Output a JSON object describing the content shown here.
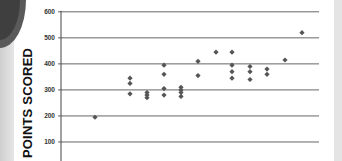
{
  "chart_data": {
    "type": "scatter",
    "title": "",
    "xlabel": "",
    "ylabel": "POINTS SCORED",
    "ylim": [
      0,
      600
    ],
    "yticks": [
      100,
      200,
      300,
      400,
      500,
      600
    ],
    "grid": true,
    "legend": null,
    "marker": "diamond",
    "marker_color": "#555555",
    "points": [
      {
        "col": 0,
        "y": 195
      },
      {
        "col": 1,
        "y": 345
      },
      {
        "col": 1,
        "y": 325
      },
      {
        "col": 1,
        "y": 285
      },
      {
        "col": 2,
        "y": 290
      },
      {
        "col": 2,
        "y": 280
      },
      {
        "col": 2,
        "y": 270
      },
      {
        "col": 3,
        "y": 395
      },
      {
        "col": 3,
        "y": 360
      },
      {
        "col": 3,
        "y": 305
      },
      {
        "col": 3,
        "y": 280
      },
      {
        "col": 4,
        "y": 310
      },
      {
        "col": 4,
        "y": 300
      },
      {
        "col": 4,
        "y": 290
      },
      {
        "col": 4,
        "y": 275
      },
      {
        "col": 5,
        "y": 410
      },
      {
        "col": 5,
        "y": 355
      },
      {
        "col": 6,
        "y": 445
      },
      {
        "col": 7,
        "y": 445
      },
      {
        "col": 7,
        "y": 395
      },
      {
        "col": 7,
        "y": 370
      },
      {
        "col": 7,
        "y": 345
      },
      {
        "col": 8,
        "y": 390
      },
      {
        "col": 8,
        "y": 370
      },
      {
        "col": 8,
        "y": 340
      },
      {
        "col": 9,
        "y": 380
      },
      {
        "col": 9,
        "y": 360
      },
      {
        "col": 10,
        "y": 415
      },
      {
        "col": 11,
        "y": 520
      }
    ],
    "column_x_px": [
      95,
      130,
      147,
      164,
      181,
      198,
      216,
      232,
      250,
      267,
      285,
      302
    ]
  },
  "axis": {
    "ylabel": "POINTS SCORED",
    "tick_labels": [
      "600",
      "500",
      "400",
      "300",
      "200",
      "100"
    ]
  }
}
